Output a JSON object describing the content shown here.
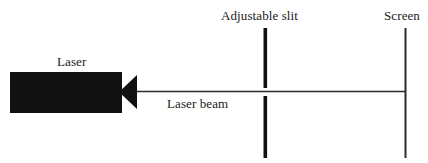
{
  "diagram": {
    "colors": {
      "ink": "#111111",
      "line": "#2b2b2b",
      "background": "#ffffff"
    },
    "labels": {
      "laser": "Laser",
      "laser_beam": "Laser beam",
      "adjustable_slit": "Adjustable slit",
      "screen": "Screen"
    },
    "components": {
      "laser_body": "laser-housing",
      "laser_nozzle": "laser-aperture-cone",
      "beam": "horizontal-beam-line",
      "slit_upper_blade": "slit-blade-upper",
      "slit_lower_blade": "slit-blade-lower",
      "screen_line": "screen-vertical-line"
    }
  }
}
